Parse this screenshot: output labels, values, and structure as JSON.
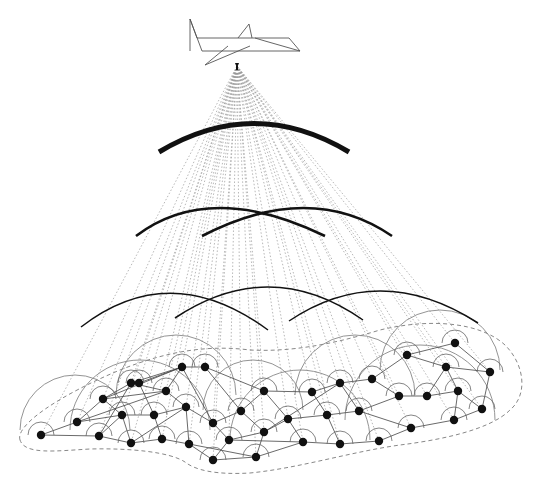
{
  "diagram": {
    "colors": {
      "background": "#ffffff",
      "aircraft_stroke": "#555555",
      "ray": "#9a9a9a",
      "wave": "#111111",
      "node": "#111111",
      "link": "#444444",
      "node_arc": "#666666",
      "boundary": "#888888"
    },
    "aircraft": {
      "label": "aircraft-icon",
      "origin": [
        237,
        66
      ]
    },
    "waves": [
      {
        "cx": 254,
        "cy": 255,
        "r": 140,
        "start": 157,
        "end": 348,
        "width": 5,
        "tier": 1
      },
      {
        "cx": 229,
        "cy": 355,
        "r": 150,
        "start": 135,
        "end": 324,
        "width": 2.6,
        "tier": 2
      },
      {
        "cx": 298,
        "cy": 355,
        "r": 150,
        "start": 203,
        "end": 390,
        "width": 2.6,
        "tier": 2
      },
      {
        "cx": 175,
        "cy": 445,
        "r": 160,
        "start": 82,
        "end": 268,
        "width": 1.5,
        "tier": 3
      },
      {
        "cx": 270,
        "cy": 437,
        "r": 150,
        "start": 175,
        "end": 366,
        "width": 1.5,
        "tier": 3
      },
      {
        "cx": 385,
        "cy": 440,
        "r": 150,
        "start": 290,
        "end": 478,
        "width": 1.5,
        "tier": 3
      }
    ],
    "nodes": [
      [
        41,
        435
      ],
      [
        77,
        422
      ],
      [
        99,
        436
      ],
      [
        103,
        399
      ],
      [
        122,
        415
      ],
      [
        131,
        383
      ],
      [
        131,
        443
      ],
      [
        139,
        383
      ],
      [
        166,
        391
      ],
      [
        154,
        415
      ],
      [
        162,
        439
      ],
      [
        182,
        367
      ],
      [
        205,
        367
      ],
      [
        186,
        407
      ],
      [
        189,
        444
      ],
      [
        213,
        423
      ],
      [
        213,
        460
      ],
      [
        229,
        440
      ],
      [
        241,
        411
      ],
      [
        256,
        457
      ],
      [
        264,
        391
      ],
      [
        264,
        432
      ],
      [
        288,
        419
      ],
      [
        303,
        442
      ],
      [
        312,
        392
      ],
      [
        327,
        415
      ],
      [
        340,
        383
      ],
      [
        340,
        444
      ],
      [
        359,
        411
      ],
      [
        372,
        379
      ],
      [
        379,
        441
      ],
      [
        399,
        396
      ],
      [
        407,
        355
      ],
      [
        411,
        428
      ],
      [
        427,
        396
      ],
      [
        446,
        367
      ],
      [
        454,
        420
      ],
      [
        455,
        343
      ],
      [
        458,
        391
      ],
      [
        482,
        409
      ],
      [
        490,
        372
      ]
    ],
    "links": [
      [
        0,
        1
      ],
      [
        0,
        2
      ],
      [
        1,
        3
      ],
      [
        1,
        4
      ],
      [
        2,
        4
      ],
      [
        2,
        5
      ],
      [
        3,
        5
      ],
      [
        3,
        4
      ],
      [
        3,
        8
      ],
      [
        4,
        9
      ],
      [
        4,
        6
      ],
      [
        2,
        6
      ],
      [
        5,
        11
      ],
      [
        5,
        8
      ],
      [
        7,
        11
      ],
      [
        7,
        9
      ],
      [
        8,
        13
      ],
      [
        8,
        11
      ],
      [
        9,
        10
      ],
      [
        9,
        13
      ],
      [
        10,
        14
      ],
      [
        10,
        6
      ],
      [
        11,
        12
      ],
      [
        11,
        15
      ],
      [
        12,
        18
      ],
      [
        12,
        20
      ],
      [
        13,
        15
      ],
      [
        13,
        14
      ],
      [
        14,
        16
      ],
      [
        15,
        17
      ],
      [
        15,
        18
      ],
      [
        16,
        17
      ],
      [
        16,
        19
      ],
      [
        17,
        21
      ],
      [
        18,
        21
      ],
      [
        18,
        20
      ],
      [
        19,
        21
      ],
      [
        19,
        23
      ],
      [
        20,
        24
      ],
      [
        20,
        22
      ],
      [
        21,
        22
      ],
      [
        22,
        25
      ],
      [
        22,
        23
      ],
      [
        23,
        27
      ],
      [
        24,
        26
      ],
      [
        24,
        25
      ],
      [
        25,
        28
      ],
      [
        25,
        27
      ],
      [
        26,
        29
      ],
      [
        26,
        28
      ],
      [
        27,
        30
      ],
      [
        28,
        31
      ],
      [
        28,
        33
      ],
      [
        29,
        32
      ],
      [
        29,
        31
      ],
      [
        30,
        33
      ],
      [
        31,
        34
      ],
      [
        32,
        37
      ],
      [
        32,
        35
      ],
      [
        33,
        36
      ],
      [
        34,
        38
      ],
      [
        34,
        35
      ],
      [
        35,
        40
      ],
      [
        35,
        38
      ],
      [
        36,
        39
      ],
      [
        37,
        40
      ],
      [
        38,
        39
      ],
      [
        38,
        36
      ],
      [
        39,
        40
      ],
      [
        6,
        13
      ],
      [
        3,
        11
      ],
      [
        1,
        8
      ],
      [
        21,
        26
      ],
      [
        17,
        23
      ],
      [
        14,
        19
      ]
    ],
    "big_arcs": [
      {
        "cx": 75,
        "cy": 430,
        "r": 55
      },
      {
        "cx": 176,
        "cy": 395,
        "r": 60
      },
      {
        "cx": 253,
        "cy": 410,
        "r": 50
      },
      {
        "cx": 355,
        "cy": 395,
        "r": 60
      },
      {
        "cx": 440,
        "cy": 370,
        "r": 60
      },
      {
        "cx": 140,
        "cy": 430,
        "r": 70
      },
      {
        "cx": 300,
        "cy": 440,
        "r": 70
      },
      {
        "cx": 420,
        "cy": 420,
        "r": 75
      }
    ],
    "boundary_path": "M 20 440 C 15 425, 60 395, 120 370 C 170 350, 210 345, 250 350 C 290 352, 330 345, 380 330 C 430 318, 480 322, 505 345 C 525 365, 528 395, 510 410 C 490 430, 440 440, 400 445 C 350 452, 300 468, 250 473 C 215 475, 195 470, 185 462 C 170 452, 130 448, 90 449 C 55 451, 25 455, 20 440 Z"
  }
}
